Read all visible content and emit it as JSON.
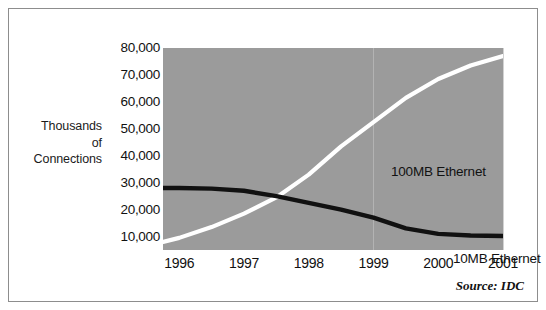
{
  "chart_data": {
    "type": "line",
    "title": "",
    "subtitle": "",
    "xlabel": "",
    "ylabel": "Thousands of Connections",
    "ylabel_lines": [
      "Thousands",
      "of",
      "Connections"
    ],
    "categories": [
      "1996",
      "1997",
      "1998",
      "1999",
      "2000",
      "2001"
    ],
    "x": [
      1996,
      1997,
      1998,
      1999,
      2000,
      2001
    ],
    "xlim": [
      1995.75,
      2001
    ],
    "ylim": [
      5000,
      80000
    ],
    "yticks": [
      80000,
      70000,
      60000,
      50000,
      40000,
      30000,
      20000,
      10000
    ],
    "ytick_labels": [
      "80,000",
      "70,000",
      "60,000",
      "50,000",
      "40,000",
      "30,000",
      "20,000",
      "10,000"
    ],
    "xtick_labels": [
      "1996",
      "1997",
      "1998",
      "1999",
      "2000",
      "2001"
    ],
    "grid": "vertical gridline at 1999 only",
    "legend": "inline labels at end of each series",
    "plot_background": "#9b9b9b",
    "series": [
      {
        "name": "100MB Ethernet",
        "color": "#ffffff",
        "label_position": "upper-right inside plot",
        "x": [
          1995.75,
          1996,
          1996.5,
          1997,
          1997.5,
          1998,
          1998.5,
          1999,
          1999.5,
          2000,
          2000.5,
          2001
        ],
        "values": [
          8000,
          9500,
          13500,
          18500,
          24500,
          33000,
          43500,
          52500,
          61500,
          68500,
          73500,
          77000
        ]
      },
      {
        "name": "10MB Ethernet",
        "color": "#111111",
        "label_position": "lower-right inside plot",
        "x": [
          1995.75,
          1996,
          1996.5,
          1997,
          1997.5,
          1998,
          1998.5,
          1999,
          1999.5,
          2000,
          2000.5,
          2001
        ],
        "values": [
          28000,
          28000,
          27800,
          27000,
          25000,
          22500,
          20000,
          17000,
          13000,
          11000,
          10400,
          10200
        ]
      }
    ],
    "annotations": [
      {
        "text": "100MB Ethernet",
        "series": "100MB Ethernet"
      },
      {
        "text": "10MB Ethernet",
        "series": "10MB Ethernet"
      }
    ],
    "source": "Source: IDC"
  },
  "source_note": "Source:  IDC"
}
